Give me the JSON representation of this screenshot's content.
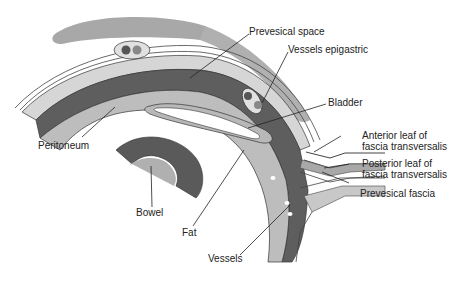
{
  "diagram": {
    "type": "anatomical cross-section",
    "labels": {
      "prevesical_space": "Prevesical space",
      "vessels_epigastric": "Vessels epigastric",
      "bladder": "Bladder",
      "anterior_leaf_1": "Anterior leaf of",
      "anterior_leaf_2": "fascia transversalis",
      "posterior_leaf_1": "Posterior leaf of",
      "posterior_leaf_2": "fascia transversalis",
      "prevesical_fascia": "Prevesical fascia",
      "peritoneum": "Peritoneum",
      "bowel": "Bowel",
      "fat": "Fat",
      "vessels": "Vessels"
    },
    "colors": {
      "muscle": "#a8a8a8",
      "light_layer": "#d4d4d4",
      "mid_layer": "#b5b5b5",
      "dark_layer": "#5a5a5a",
      "line": "#333333",
      "white": "#ffffff"
    }
  }
}
